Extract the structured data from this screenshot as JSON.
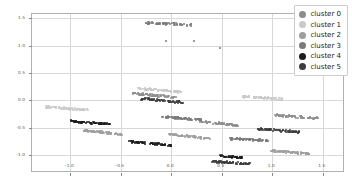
{
  "chart_data": {
    "type": "scatter",
    "title": "",
    "xlabel": "",
    "ylabel": "",
    "xlim": [
      -1.38,
      1.72
    ],
    "ylim": [
      -1.33,
      1.58
    ],
    "xticks": [
      -1.0,
      -0.5,
      0.0,
      0.5,
      1.0,
      1.5
    ],
    "xticklabels": [
      "-1.0",
      "-0.5",
      "0.0",
      "0.5",
      "1.0",
      "1.5"
    ],
    "yticks": [
      -1.0,
      -0.5,
      0.0,
      0.5,
      1.0,
      1.5
    ],
    "yticklabels": [
      "-1.0",
      "-0.5",
      "0.0",
      "0.5",
      "1.0",
      "1.5"
    ],
    "grid": true,
    "legend_position": "upper right",
    "marker_size": 2,
    "series": [
      {
        "name": "cluster 0",
        "color": "#8c8c8c",
        "bands": [
          {
            "x0": -0.38,
            "x1": 0.06,
            "y0": 0.13,
            "y1": 0.05,
            "n": 70
          },
          {
            "x0": 0.26,
            "x1": 0.66,
            "y0": -0.38,
            "y1": -0.46,
            "n": 70
          },
          {
            "x0": 1.03,
            "x1": 1.45,
            "y0": -0.27,
            "y1": -0.33,
            "n": 70
          }
        ]
      },
      {
        "name": "cluster 1",
        "color": "#c9c9c9",
        "bands": [
          {
            "x0": -1.24,
            "x1": -0.82,
            "y0": -0.12,
            "y1": -0.18,
            "n": 70
          },
          {
            "x0": -0.33,
            "x1": 0.1,
            "y0": 0.22,
            "y1": 0.15,
            "n": 70
          },
          {
            "x0": 0.7,
            "x1": 1.1,
            "y0": 0.07,
            "y1": 0.02,
            "n": 70
          }
        ]
      },
      {
        "name": "cluster 2",
        "color": "#9e9e9e",
        "bands": [
          {
            "x0": -0.88,
            "x1": -0.49,
            "y0": -0.55,
            "y1": -0.62,
            "n": 70
          },
          {
            "x0": -0.02,
            "x1": 0.38,
            "y0": -0.62,
            "y1": -0.7,
            "n": 70
          },
          {
            "x0": 0.98,
            "x1": 1.38,
            "y0": -0.92,
            "y1": -0.98,
            "n": 70
          }
        ]
      },
      {
        "name": "cluster 3",
        "color": "#7a7a7a",
        "bands": [
          {
            "x0": -0.26,
            "x1": 0.2,
            "y0": 1.42,
            "y1": 1.38,
            "n": 60
          },
          {
            "x0": -0.1,
            "x1": 0.3,
            "y0": -0.3,
            "y1": -0.36,
            "n": 70
          },
          {
            "x0": 0.58,
            "x1": 0.97,
            "y0": -0.7,
            "y1": -0.74,
            "n": 70
          }
        ],
        "points": [
          {
            "x": -0.05,
            "y": 1.08
          },
          {
            "x": 0.22,
            "y": 1.08
          },
          {
            "x": 0.48,
            "y": 0.96
          }
        ]
      },
      {
        "name": "cluster 4",
        "color": "#1c1c1c",
        "bands": [
          {
            "x0": -1.0,
            "x1": -0.6,
            "y0": -0.38,
            "y1": -0.44,
            "n": 70
          },
          {
            "x0": -0.42,
            "x1": 0.0,
            "y0": -0.76,
            "y1": -0.82,
            "n": 70
          },
          {
            "x0": 0.48,
            "x1": 0.7,
            "y0": -1.02,
            "y1": -1.05,
            "n": 45
          }
        ]
      },
      {
        "name": "cluster 5",
        "color": "#3d3d3d",
        "bands": [
          {
            "x0": -0.3,
            "x1": 0.12,
            "y0": 0.03,
            "y1": -0.04,
            "n": 70
          },
          {
            "x0": 0.4,
            "x1": 0.78,
            "y0": -1.12,
            "y1": -1.16,
            "n": 70
          },
          {
            "x0": 0.85,
            "x1": 1.27,
            "y0": -0.52,
            "y1": -0.58,
            "n": 70
          }
        ]
      }
    ]
  },
  "legend": {
    "items": [
      {
        "label": "cluster 0",
        "color": "#8c8c8c"
      },
      {
        "label": "cluster 1",
        "color": "#c9c9c9"
      },
      {
        "label": "cluster 2",
        "color": "#9e9e9e"
      },
      {
        "label": "cluster 3",
        "color": "#7a7a7a"
      },
      {
        "label": "cluster 4",
        "color": "#1c1c1c"
      },
      {
        "label": "cluster 5",
        "color": "#3d3d3d"
      }
    ]
  }
}
